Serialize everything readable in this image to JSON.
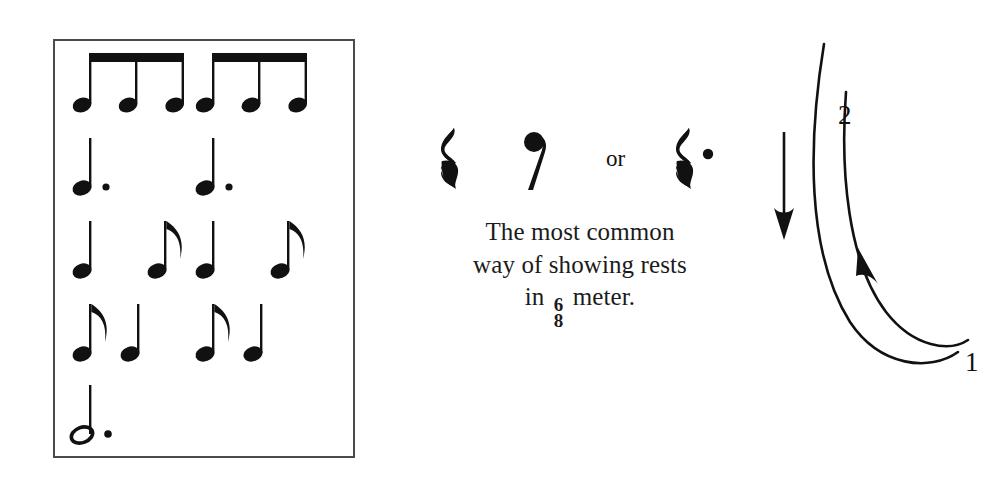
{
  "page": {
    "background": "#ffffff",
    "ink": "#111111",
    "box_border": "#4a4a4a"
  },
  "rhythm_box": {
    "name": "six-eight-rhythm-patterns",
    "rows": [
      {
        "label": "six beamed eighth notes",
        "groups": [
          {
            "notes": [
              "eighth-note",
              "eighth-note",
              "eighth-note"
            ],
            "beamed": true
          },
          {
            "notes": [
              "eighth-note",
              "eighth-note",
              "eighth-note"
            ],
            "beamed": true
          }
        ]
      },
      {
        "label": "two dotted quarter notes",
        "groups": [
          {
            "notes": [
              "dotted-quarter-note"
            ],
            "beamed": false
          },
          {
            "notes": [
              "dotted-quarter-note"
            ],
            "beamed": false
          }
        ]
      },
      {
        "label": "quarter note plus eighth note, twice",
        "groups": [
          {
            "notes": [
              "quarter-note",
              "eighth-note"
            ],
            "beamed": false
          },
          {
            "notes": [
              "quarter-note",
              "eighth-note"
            ],
            "beamed": false
          }
        ]
      },
      {
        "label": "eighth note plus quarter note, twice",
        "groups": [
          {
            "notes": [
              "eighth-note",
              "quarter-note"
            ],
            "beamed": false
          },
          {
            "notes": [
              "eighth-note",
              "quarter-note"
            ],
            "beamed": false
          }
        ]
      },
      {
        "label": "one dotted half note",
        "groups": [
          {
            "notes": [
              "dotted-half-note"
            ],
            "beamed": false
          }
        ]
      }
    ]
  },
  "rests": {
    "symbols": [
      {
        "name": "quarter-rest",
        "value": "quarter rest"
      },
      {
        "name": "eighth-rest",
        "value": "eighth rest"
      },
      {
        "name": "dotted-quarter-rest",
        "value": "dotted quarter rest"
      }
    ],
    "conjunction": "or",
    "caption_line1": "The most common",
    "caption_line2": "way of showing rests",
    "caption_line3_before": "in",
    "caption_line3_after": "meter.",
    "time_signature_top": "6",
    "time_signature_bottom": "8"
  },
  "conducting": {
    "name": "two-beat conducting pattern",
    "downbeat_arrow": "downward-arrow",
    "beat_labels": [
      "1",
      "2"
    ],
    "beat_1": "1",
    "beat_2": "2"
  }
}
